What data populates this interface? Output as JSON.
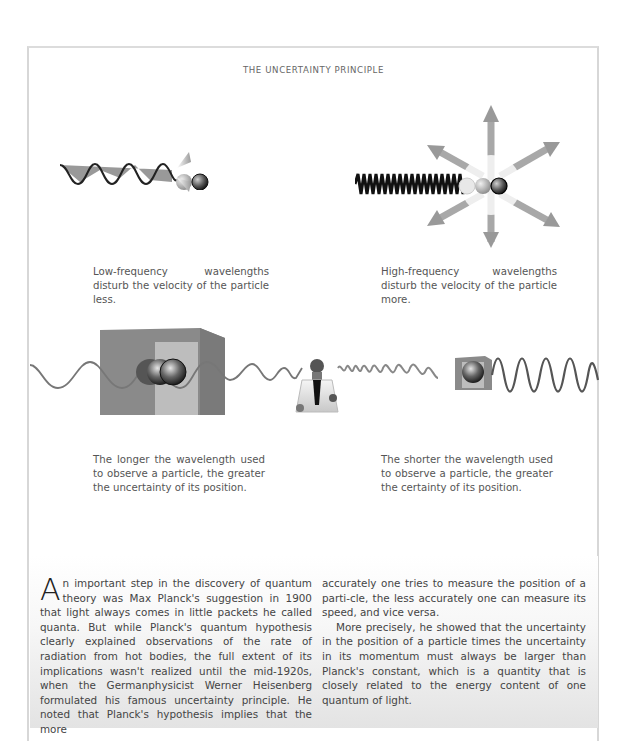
{
  "page": {
    "title": "THE UNCERTAINTY PRINCIPLE"
  },
  "figures": {
    "low_frequency": {
      "caption": "Low-frequency wavelengths disturb the velocity of the particle less."
    },
    "high_frequency": {
      "caption": "High-frequency wavelengths disturb the velocity of the particle more."
    },
    "long_wavelength": {
      "caption": "The longer the wavelength used to observe a particle, the greater the uncertainty of its position."
    },
    "short_wavelength": {
      "caption": "The shorter the wavelength used to observe a particle, the greater the certainty of its position."
    }
  },
  "body": {
    "dropcap": "A",
    "col1_p1": "n important step in the discovery of quantum theory was Max Planck's suggestion in 1900 that light always comes in little packets he called quanta. But while Planck's quantum hypothesis clearly explained observations of the rate of radiation from hot bodies, the full extent of its implications wasn't realized until the mid-1920s, when the Germanphysicist Werner Heisenberg formulated his famous uncertainty principle. He noted that Planck's hypothesis implies that the more",
    "col2_p1": "accurately one tries to measure the position of a parti-cle, the less accurately one can measure its speed, and vice versa.",
    "col2_p2": "More precisely, he showed that the uncertainty in the position of a particle times the uncertainty in its momentum must always be larger than Planck's constant, which is a quantity that is closely related to the energy content of one quantum of light."
  },
  "colors": {
    "frame_border": "#d7d7d7",
    "wave_dark": "#333333",
    "wave_light": "#9a9a9a",
    "box_grey": "#8a8a8a"
  }
}
